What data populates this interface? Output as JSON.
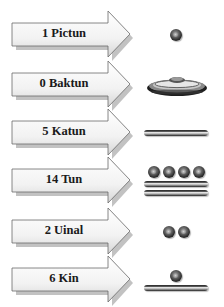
{
  "rows": [
    {
      "label": "1 Pictun",
      "value": 1,
      "glyph": {
        "bars": 0,
        "dots": 1,
        "shell": false
      }
    },
    {
      "label": "0 Baktun",
      "value": 0,
      "glyph": {
        "bars": 0,
        "dots": 0,
        "shell": true
      }
    },
    {
      "label": "5 Katun",
      "value": 5,
      "glyph": {
        "bars": 1,
        "dots": 0,
        "shell": false
      }
    },
    {
      "label": "14 Tun",
      "value": 14,
      "glyph": {
        "bars": 2,
        "dots": 4,
        "shell": false
      }
    },
    {
      "label": "2 Uinal",
      "value": 2,
      "glyph": {
        "bars": 0,
        "dots": 2,
        "shell": false
      }
    },
    {
      "label": "6 Kin",
      "value": 6,
      "glyph": {
        "bars": 1,
        "dots": 1,
        "shell": false
      }
    }
  ],
  "icons": {
    "arrow": "right-arrow-icon",
    "dot": "dot-one-icon",
    "bar": "bar-five-icon",
    "shell": "shell-zero-icon"
  }
}
